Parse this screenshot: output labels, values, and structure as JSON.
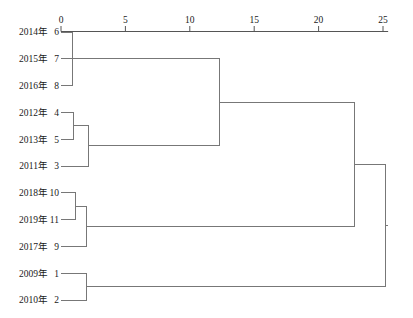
{
  "chart_data": {
    "type": "dendrogram",
    "title": "",
    "xlabel": "",
    "ylabel": "",
    "xlim": [
      0,
      25.4
    ],
    "grid": false,
    "legend": false,
    "axis_ticks": [
      {
        "value": 0,
        "label": "0"
      },
      {
        "value": 5,
        "label": "5"
      },
      {
        "value": 10,
        "label": "10"
      },
      {
        "value": 15,
        "label": "15"
      },
      {
        "value": 20,
        "label": "20"
      },
      {
        "value": 25,
        "label": "25"
      }
    ],
    "leaves": [
      {
        "id": 6,
        "year_label": "2014年",
        "num_label": "6",
        "order": 0
      },
      {
        "id": 7,
        "year_label": "2015年",
        "num_label": "7",
        "order": 1
      },
      {
        "id": 8,
        "year_label": "2016年",
        "num_label": "8",
        "order": 2
      },
      {
        "id": 4,
        "year_label": "2012年",
        "num_label": "4",
        "order": 3
      },
      {
        "id": 5,
        "year_label": "2013年",
        "num_label": "5",
        "order": 4
      },
      {
        "id": 3,
        "year_label": "2011年",
        "num_label": "3",
        "order": 5
      },
      {
        "id": 10,
        "year_label": "2018年",
        "num_label": "10",
        "order": 6
      },
      {
        "id": 11,
        "year_label": "2019年",
        "num_label": "11",
        "order": 7
      },
      {
        "id": 9,
        "year_label": "2017年",
        "num_label": "9",
        "order": 8
      },
      {
        "id": 1,
        "year_label": "2009年",
        "num_label": "1",
        "order": 9
      },
      {
        "id": 2,
        "year_label": "2010年",
        "num_label": "2",
        "order": 10
      }
    ],
    "merges": [
      {
        "name": "m1",
        "left": "leaf:6",
        "right": "leaf:8",
        "distance": 0.9
      },
      {
        "name": "m2",
        "left": "m1",
        "right": "leaf:7",
        "distance": 4.0
      },
      {
        "name": "m3",
        "left": "leaf:4",
        "right": "leaf:5",
        "distance": 1.0
      },
      {
        "name": "m4",
        "left": "m3",
        "right": "leaf:3",
        "distance": 2.1
      },
      {
        "name": "m5",
        "left": "leaf:10",
        "right": "leaf:11",
        "distance": 1.1
      },
      {
        "name": "m6",
        "left": "m5",
        "right": "leaf:9",
        "distance": 2.0
      },
      {
        "name": "m7",
        "left": "leaf:1",
        "right": "leaf:2",
        "distance": 2.0
      },
      {
        "name": "m8",
        "left": "m2",
        "right": "m4",
        "distance": 12.3
      },
      {
        "name": "m9",
        "left": "m8",
        "right": "m6",
        "distance": 22.8
      },
      {
        "name": "m10",
        "left": "m9",
        "right": "m7",
        "distance": 25.2
      }
    ],
    "colors": {
      "link": "#777777",
      "axis": "#555555",
      "text": "#1a1a1a",
      "background": "#ffffff"
    }
  }
}
